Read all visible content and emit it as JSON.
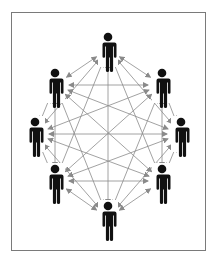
{
  "diagram": {
    "type": "fully-connected-network",
    "colors": {
      "person": "#111111",
      "edge": "#8a8a8a",
      "frame": "#7a7a7a",
      "background": "#ffffff"
    },
    "nodes": [
      {
        "id": "top",
        "x": 108,
        "y": 49
      },
      {
        "id": "upper-right",
        "x": 162,
        "y": 85
      },
      {
        "id": "mid-right",
        "x": 181,
        "y": 134
      },
      {
        "id": "lower-right",
        "x": 162,
        "y": 181
      },
      {
        "id": "bottom",
        "x": 108,
        "y": 218
      },
      {
        "id": "lower-left",
        "x": 55,
        "y": 181
      },
      {
        "id": "mid-left",
        "x": 35,
        "y": 134
      },
      {
        "id": "upper-left",
        "x": 55,
        "y": 85
      }
    ],
    "edges": "all-pairs",
    "edge_style": "double-headed-arrow"
  }
}
